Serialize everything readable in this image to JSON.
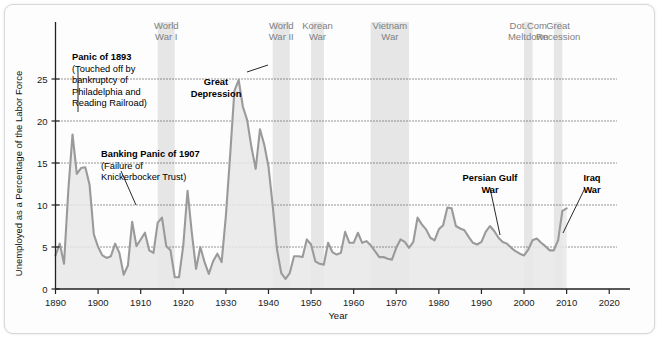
{
  "chart_data": {
    "type": "area",
    "title": "",
    "xlabel": "Year",
    "ylabel": "Unemployed as a Percentage of the Labor Force",
    "xlim": [
      1890,
      2023
    ],
    "ylim": [
      0,
      27.5
    ],
    "grid": "horizontal-dotted",
    "legend": "none",
    "line_color": "#9a9a9a",
    "fill_color": "#e8e8e8",
    "band_color": "#e6e6e6",
    "xticks": [
      1890,
      1900,
      1910,
      1920,
      1930,
      1940,
      1950,
      1960,
      1970,
      1980,
      1990,
      2000,
      2010,
      2020
    ],
    "yticks": [
      0,
      5,
      10,
      15,
      20,
      25
    ],
    "series_name": "Unemployment rate",
    "x": [
      1890,
      1891,
      1892,
      1893,
      1894,
      1895,
      1896,
      1897,
      1898,
      1899,
      1900,
      1901,
      1902,
      1903,
      1904,
      1905,
      1906,
      1907,
      1908,
      1909,
      1910,
      1911,
      1912,
      1913,
      1914,
      1915,
      1916,
      1917,
      1918,
      1919,
      1920,
      1921,
      1922,
      1923,
      1924,
      1925,
      1926,
      1927,
      1928,
      1929,
      1930,
      1931,
      1932,
      1933,
      1934,
      1935,
      1936,
      1937,
      1938,
      1939,
      1940,
      1941,
      1942,
      1943,
      1944,
      1945,
      1946,
      1947,
      1948,
      1949,
      1950,
      1951,
      1952,
      1953,
      1954,
      1955,
      1956,
      1957,
      1958,
      1959,
      1960,
      1961,
      1962,
      1963,
      1964,
      1965,
      1966,
      1967,
      1968,
      1969,
      1970,
      1971,
      1972,
      1973,
      1974,
      1975,
      1976,
      1977,
      1978,
      1979,
      1980,
      1981,
      1982,
      1983,
      1984,
      1985,
      1986,
      1987,
      1988,
      1989,
      1990,
      1991,
      1992,
      1993,
      1994,
      1995,
      1996,
      1997,
      1998,
      1999,
      2000,
      2001,
      2002,
      2003,
      2004,
      2005,
      2006,
      2007,
      2008,
      2009,
      2010
    ],
    "values": [
      4.0,
      5.4,
      3.0,
      11.7,
      18.4,
      13.7,
      14.4,
      14.5,
      12.4,
      6.5,
      5.0,
      4.0,
      3.7,
      3.9,
      5.4,
      4.3,
      1.7,
      2.8,
      8.0,
      5.1,
      5.9,
      6.7,
      4.6,
      4.3,
      7.9,
      8.5,
      5.1,
      4.6,
      1.4,
      1.4,
      5.2,
      11.7,
      6.7,
      2.4,
      5.0,
      3.2,
      1.8,
      3.3,
      4.2,
      3.2,
      8.7,
      15.9,
      23.6,
      24.9,
      21.7,
      20.1,
      16.9,
      14.3,
      19.0,
      17.2,
      14.6,
      9.9,
      4.7,
      1.9,
      1.2,
      1.9,
      3.9,
      3.9,
      3.8,
      5.9,
      5.3,
      3.3,
      3.0,
      2.9,
      5.5,
      4.4,
      4.1,
      4.3,
      6.8,
      5.5,
      5.5,
      6.7,
      5.5,
      5.7,
      5.2,
      4.5,
      3.8,
      3.8,
      3.6,
      3.5,
      4.9,
      5.9,
      5.6,
      4.9,
      5.6,
      8.5,
      7.7,
      7.1,
      6.1,
      5.8,
      7.1,
      7.6,
      9.7,
      9.6,
      7.5,
      7.2,
      7.0,
      6.2,
      5.5,
      5.3,
      5.6,
      6.8,
      7.5,
      6.9,
      6.1,
      5.6,
      5.4,
      4.9,
      4.5,
      4.2,
      4.0,
      4.7,
      5.8,
      6.0,
      5.5,
      5.1,
      4.6,
      4.6,
      5.8,
      9.3,
      9.6
    ],
    "shaded_events": [
      {
        "label_line1": "World",
        "label_line2": "War I",
        "start": 1914,
        "end": 1918
      },
      {
        "label_line1": "World",
        "label_line2": "War II",
        "start": 1941,
        "end": 1945
      },
      {
        "label_line1": "Korean",
        "label_line2": "War",
        "start": 1950,
        "end": 1953
      },
      {
        "label_line1": "Vietnam",
        "label_line2": "War",
        "start": 1964,
        "end": 1973
      },
      {
        "label_line1": "Dot.Com",
        "label_line2": "Meltdown",
        "start": 2000,
        "end": 2002
      },
      {
        "label_line1": "Great",
        "label_line2": "Recession",
        "start": 2007,
        "end": 2009
      }
    ],
    "annotations": [
      {
        "name": "panic-1893",
        "lines": [
          "Panic of 1893",
          "(Touched off by",
          "bankruptcy of",
          "Philadelphia and",
          "Reading Railroad)"
        ],
        "bold_lines": 1
      },
      {
        "name": "banking-panic-1907",
        "lines": [
          "Banking Panic of 1907",
          "(Failure of",
          "Knickerbocker Trust)"
        ],
        "bold_lines": 1
      },
      {
        "name": "great-depression",
        "lines": [
          "Great",
          "Depression"
        ],
        "bold_lines": 2
      },
      {
        "name": "persian-gulf-war",
        "lines": [
          "Persian Gulf",
          "War"
        ],
        "bold_lines": 2
      },
      {
        "name": "iraq-war",
        "lines": [
          "Iraq",
          "War"
        ],
        "bold_lines": 2
      }
    ]
  }
}
